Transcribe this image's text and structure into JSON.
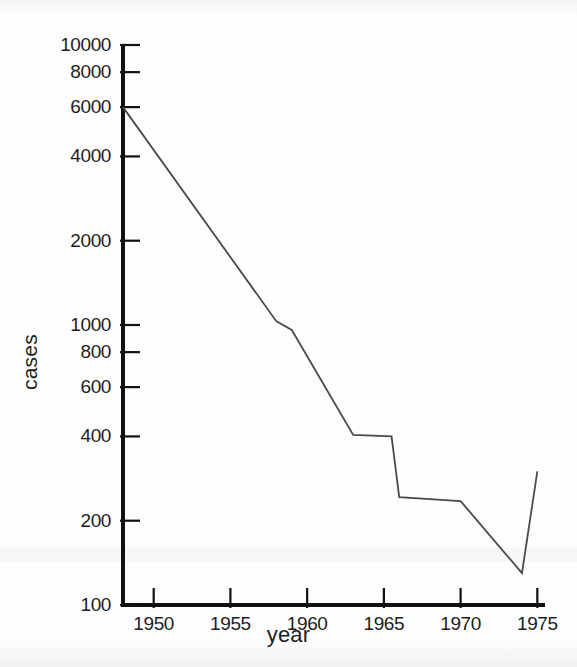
{
  "chart_data": {
    "type": "line",
    "title": "",
    "subtitle": "",
    "xlabel": "year",
    "ylabel": "cases",
    "yscale": "log",
    "xscale": "linear",
    "grid": false,
    "legend": null,
    "xlim": [
      1948,
      1975.5
    ],
    "ylim": [
      100,
      10000
    ],
    "xticks": [
      1950,
      1955,
      1960,
      1965,
      1970,
      1975
    ],
    "xtick_labels": [
      "1950",
      "1955",
      "1960",
      "1965",
      "1970",
      "1975"
    ],
    "yticks": [
      100,
      200,
      400,
      600,
      800,
      1000,
      2000,
      4000,
      6000,
      8000,
      10000
    ],
    "ytick_labels": [
      "100",
      "200",
      "400",
      "600",
      "800",
      "1000",
      "2000",
      "4000",
      "6000",
      "8000",
      "10000"
    ],
    "series": [
      {
        "name": "cases",
        "color": "#4a4a4a",
        "x": [
          1948,
          1958,
          1959,
          1963,
          1965.5,
          1966,
          1970,
          1974,
          1975
        ],
        "values": [
          6000,
          1030,
          960,
          405,
          400,
          243,
          235,
          130,
          300
        ]
      }
    ]
  },
  "axes": {
    "y_title": "cases",
    "x_title": "year"
  },
  "style": {
    "axis_color": "#111111",
    "line_color": "#4a4a4a",
    "text_color": "#1d1d1d",
    "background": "#fdfdfd"
  }
}
